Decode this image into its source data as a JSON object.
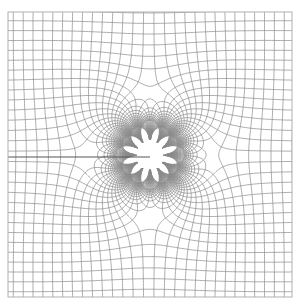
{
  "figure": {
    "type": "conformal-map-grid",
    "frame": {
      "x": 8,
      "y": 12,
      "width": 284,
      "height": 285
    },
    "center": {
      "x": 150,
      "y": 155
    },
    "branch_cut": {
      "side": "left",
      "y": 157
    },
    "colors": {
      "background": "#ffffff",
      "line": "#8a8a8a",
      "frame": "#b0b0b0",
      "cut": "#555555"
    },
    "function": "f(z) = z + k / z^3",
    "k": 0.02,
    "scale_px_per_unit": 125,
    "levels": {
      "min": -1.25,
      "max": 1.25,
      "step": 0.08
    }
  }
}
